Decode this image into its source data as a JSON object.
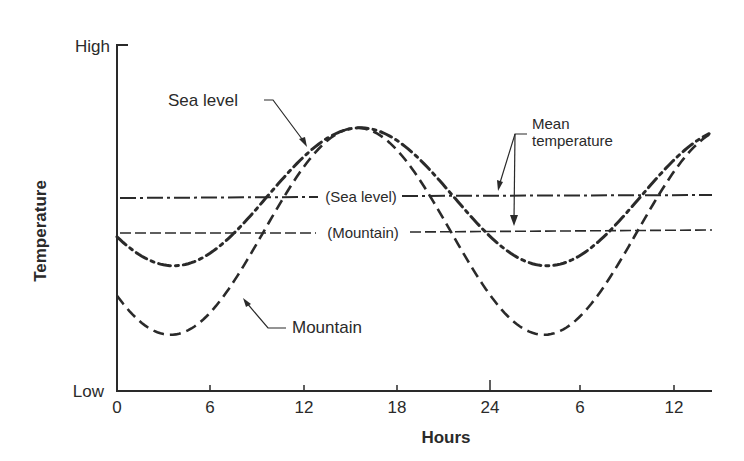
{
  "chart_data": {
    "type": "line",
    "title": "",
    "xlabel": "Hours",
    "ylabel": "Temperature",
    "y_tick_labels": [
      "Low",
      "High"
    ],
    "x_ticks": [
      0,
      6,
      12,
      18,
      24,
      30,
      36
    ],
    "x_tick_labels": [
      "0",
      "6",
      "12",
      "18",
      "24",
      "6",
      "12"
    ],
    "xlim": [
      0,
      38.4
    ],
    "ylim": [
      0,
      10
    ],
    "y_units": "relative (Low=0, High=10)",
    "grid": false,
    "legend": "none (direct labels)",
    "series": [
      {
        "name": "Sea level",
        "style": "dash-dot",
        "mean": 5.6,
        "amplitude": 2.0,
        "peak_hour": 15.7,
        "points": [
          {
            "x": 0,
            "y": 4.6
          },
          {
            "x": 2,
            "y": 3.9
          },
          {
            "x": 4.7,
            "y": 3.6
          },
          {
            "x": 8,
            "y": 4.2
          },
          {
            "x": 10.2,
            "y": 5.6
          },
          {
            "x": 13,
            "y": 7.1
          },
          {
            "x": 15.7,
            "y": 7.6
          },
          {
            "x": 18,
            "y": 7.2
          },
          {
            "x": 21.2,
            "y": 5.6
          },
          {
            "x": 24,
            "y": 4.3
          },
          {
            "x": 27.7,
            "y": 3.6
          },
          {
            "x": 30,
            "y": 4.0
          },
          {
            "x": 33.2,
            "y": 5.6
          },
          {
            "x": 36,
            "y": 7.0
          },
          {
            "x": 38.4,
            "y": 7.7
          }
        ]
      },
      {
        "name": "Mountain",
        "style": "dashed",
        "mean": 4.6,
        "amplitude": 3.0,
        "peak_hour": 15.5,
        "points": [
          {
            "x": 0,
            "y": 3.6
          },
          {
            "x": 2,
            "y": 2.2
          },
          {
            "x": 4.5,
            "y": 1.4
          },
          {
            "x": 8,
            "y": 2.6
          },
          {
            "x": 10,
            "y": 4.6
          },
          {
            "x": 13,
            "y": 6.9
          },
          {
            "x": 15.5,
            "y": 7.4
          },
          {
            "x": 18,
            "y": 6.7
          },
          {
            "x": 21,
            "y": 4.6
          },
          {
            "x": 24,
            "y": 2.6
          },
          {
            "x": 27.7,
            "y": 1.4
          },
          {
            "x": 30,
            "y": 2.2
          },
          {
            "x": 33,
            "y": 4.6
          },
          {
            "x": 36,
            "y": 6.7
          },
          {
            "x": 38.4,
            "y": 7.4
          }
        ]
      },
      {
        "name": "Mean temperature (Sea level)",
        "style": "dash-dot thin",
        "points": [
          {
            "x": 0,
            "y": 5.6
          },
          {
            "x": 38.4,
            "y": 5.6
          }
        ]
      },
      {
        "name": "Mean temperature (Mountain)",
        "style": "dashed thin",
        "points": [
          {
            "x": 0,
            "y": 4.6
          },
          {
            "x": 38.4,
            "y": 4.6
          }
        ]
      }
    ],
    "annotations": [
      {
        "text": "Sea level",
        "points_to": "Sea level curve"
      },
      {
        "text": "Mountain",
        "points_to": "Mountain curve"
      },
      {
        "text": "Mean temperature",
        "points_to": [
          "Sea level mean line",
          "Mountain mean line"
        ]
      },
      {
        "text": "(Sea level)",
        "on": "Sea level mean line"
      },
      {
        "text": "(Mountain)",
        "on": "Mountain mean line"
      }
    ]
  },
  "labels": {
    "y_high": "High",
    "y_low": "Low",
    "y_title": "Temperature",
    "x_title": "Hours",
    "x_ticks": [
      "0",
      "6",
      "12",
      "18",
      "24",
      "6",
      "12"
    ],
    "sea_level": "Sea level",
    "mountain": "Mountain",
    "mean_line1": "Mean",
    "mean_line2": "temperature",
    "mean_sea": "(Sea level)",
    "mean_mountain": "(Mountain)"
  },
  "colors": {
    "ink": "#2a2a2a",
    "background": "#ffffff"
  }
}
